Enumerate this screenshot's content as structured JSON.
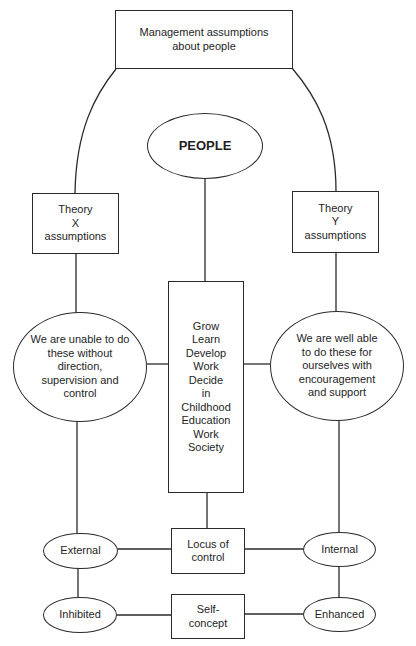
{
  "diagram": {
    "type": "concept-map",
    "nodes": {
      "top": {
        "label": "Management assumptions\nabout people",
        "shape": "rectangle"
      },
      "people": {
        "label": "PEOPLE",
        "shape": "ellipse"
      },
      "theory_x": {
        "label": "Theory\nX\nassumptions",
        "shape": "rectangle"
      },
      "theory_y": {
        "label": "Theory\nY\nassumptions",
        "shape": "rectangle"
      },
      "unable": {
        "label": "We are unable to do\nthese without\ndirection,\nsupervision and\ncontrol",
        "shape": "ellipse"
      },
      "able": {
        "label": "We are well able\nto do these for\nourselves with\nencouragement\nand support",
        "shape": "ellipse"
      },
      "center": {
        "label": "Grow\nLearn\nDevelop\nWork\nDecide\nin\nChildhood\nEducation\nWork\nSociety",
        "shape": "rectangle"
      },
      "locus": {
        "label": "Locus of\ncontrol",
        "shape": "rectangle"
      },
      "external": {
        "label": "External",
        "shape": "ellipse"
      },
      "internal": {
        "label": "Internal",
        "shape": "ellipse"
      },
      "self_concept": {
        "label": "Self-\nconcept",
        "shape": "rectangle"
      },
      "inhibited": {
        "label": "Inhibited",
        "shape": "ellipse"
      },
      "enhanced": {
        "label": "Enhanced",
        "shape": "ellipse"
      }
    },
    "edges": [
      [
        "top",
        "theory_x"
      ],
      [
        "top",
        "theory_y"
      ],
      [
        "theory_x",
        "unable"
      ],
      [
        "theory_y",
        "able"
      ],
      [
        "people",
        "center"
      ],
      [
        "center",
        "unable"
      ],
      [
        "center",
        "able"
      ],
      [
        "center",
        "locus"
      ],
      [
        "unable",
        "external"
      ],
      [
        "able",
        "internal"
      ],
      [
        "locus",
        "external"
      ],
      [
        "locus",
        "internal"
      ],
      [
        "external",
        "inhibited"
      ],
      [
        "internal",
        "enhanced"
      ],
      [
        "self_concept",
        "inhibited"
      ],
      [
        "self_concept",
        "enhanced"
      ]
    ],
    "colors": {
      "stroke": "#2a2a2a",
      "text": "#1e1e1e",
      "background": "#ffffff"
    }
  }
}
